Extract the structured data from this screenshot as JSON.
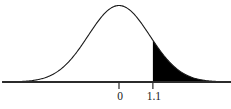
{
  "chart_data": {
    "type": "area",
    "title": "",
    "subtitle": "",
    "xlabel": "",
    "ylabel": "",
    "distribution": {
      "name": "standard normal",
      "mean": 0,
      "sd": 1
    },
    "axis": {
      "show_y_axis": false,
      "grid": false,
      "baseline": true,
      "xlim": [
        -3.7,
        3.55
      ]
    },
    "tick_values": [
      0,
      1.1
    ],
    "tick_labels": [
      "0",
      "1.1"
    ],
    "shaded_region": {
      "from": 1.1,
      "to": 3.55,
      "side": "right-tail",
      "fill": "#000000",
      "label": ""
    },
    "curve": {
      "stroke": "#1a1a1a",
      "stroke_width": 1.1,
      "fill": "none"
    },
    "x": [
      -3.7,
      -3.5,
      -3.3,
      -3.1,
      -2.9,
      -2.7,
      -2.5,
      -2.3,
      -2.1,
      -1.9,
      -1.7,
      -1.5,
      -1.3,
      -1.1,
      -0.9,
      -0.7,
      -0.5,
      -0.3,
      -0.1,
      0.1,
      0.3,
      0.5,
      0.7,
      0.9,
      1.1,
      1.3,
      1.5,
      1.7,
      1.9,
      2.1,
      2.3,
      2.5,
      2.7,
      2.9,
      3.1,
      3.3,
      3.55
    ],
    "y": [
      0.0004,
      0.0009,
      0.0017,
      0.0033,
      0.006,
      0.0104,
      0.0175,
      0.0283,
      0.044,
      0.0656,
      0.094,
      0.1295,
      0.1714,
      0.2179,
      0.2661,
      0.3123,
      0.3521,
      0.3814,
      0.397,
      0.397,
      0.3814,
      0.3521,
      0.3123,
      0.2661,
      0.2179,
      0.1714,
      0.1295,
      0.094,
      0.0656,
      0.044,
      0.0283,
      0.0175,
      0.0104,
      0.006,
      0.0033,
      0.0017,
      0.0007
    ]
  },
  "labels": {
    "tick_zero": "0",
    "tick_cutoff": "1.1"
  },
  "colors": {
    "background": "#ffffff",
    "axis": "#2b2b2b",
    "curve": "#1a1a1a",
    "shade": "#000000",
    "text": "#1a1a1a"
  }
}
